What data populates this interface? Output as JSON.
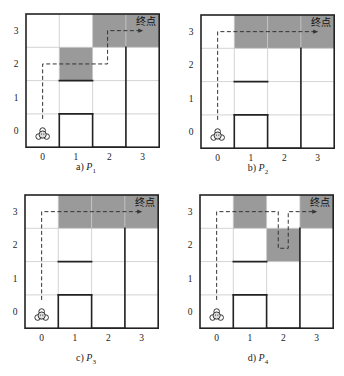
{
  "figure": {
    "goal_label": "终点",
    "x_ticks": [
      "0",
      "1",
      "2",
      "3"
    ],
    "y_ticks": [
      "0",
      "1",
      "2",
      "3"
    ],
    "colors": {
      "shade": "#9a9a9a",
      "grid": "#c8c8c8",
      "wall": "#222222",
      "path": "#333333"
    },
    "panels": [
      {
        "id": "a",
        "caption_prefix": "a)",
        "caption_var": "P",
        "caption_sub": "1",
        "origin": [
          26,
          14
        ],
        "shaded": [
          [
            2,
            3
          ],
          [
            3,
            3
          ],
          [
            1,
            2
          ]
        ],
        "path": [
          [
            0,
            0.35
          ],
          [
            0,
            2
          ],
          [
            1.95,
            2
          ],
          [
            1.95,
            3
          ],
          [
            2.9,
            3
          ]
        ]
      },
      {
        "id": "b",
        "caption_prefix": "b)",
        "caption_var": "P",
        "caption_sub": "2",
        "origin": [
          29,
          15
        ],
        "shaded": [
          [
            1,
            3
          ],
          [
            2,
            3
          ],
          [
            3,
            3
          ]
        ],
        "path": [
          [
            0,
            0.35
          ],
          [
            0,
            3
          ],
          [
            2.9,
            3
          ]
        ]
      },
      {
        "id": "c",
        "caption_prefix": "c)",
        "caption_var": "P",
        "caption_sub": "3",
        "origin": [
          25,
          7
        ],
        "shaded": [
          [
            1,
            3
          ],
          [
            2,
            3
          ],
          [
            3,
            3
          ]
        ],
        "path": [
          [
            0,
            0.35
          ],
          [
            0,
            3
          ],
          [
            2.9,
            3
          ]
        ]
      },
      {
        "id": "d",
        "caption_prefix": "d)",
        "caption_var": "P",
        "caption_sub": "4",
        "origin": [
          28,
          7
        ],
        "shaded": [
          [
            1,
            3
          ],
          [
            3,
            3
          ],
          [
            2,
            2
          ]
        ],
        "path": [
          [
            0,
            0.35
          ],
          [
            0,
            3
          ],
          [
            1.85,
            3
          ],
          [
            1.85,
            1.9
          ],
          [
            2.15,
            1.9
          ],
          [
            2.15,
            3
          ],
          [
            2.9,
            3
          ]
        ]
      }
    ],
    "walls": [
      [
        [
          1,
          0
        ],
        [
          1,
          1
        ]
      ],
      [
        [
          1,
          1
        ],
        [
          2,
          1
        ]
      ],
      [
        [
          2,
          1
        ],
        [
          2,
          0
        ]
      ],
      [
        [
          2,
          0
        ],
        [
          3,
          0
        ]
      ],
      [
        [
          3,
          0
        ],
        [
          3,
          3
        ]
      ],
      [
        [
          1,
          2
        ],
        [
          2,
          2
        ]
      ]
    ]
  }
}
